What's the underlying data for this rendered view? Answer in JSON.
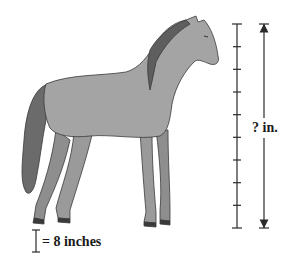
{
  "figure": {
    "measure_label": "? in.",
    "legend": {
      "unit_symbol": "I",
      "text": "= 8 inches"
    },
    "scale": {
      "tick_count": 10,
      "intervals": 9,
      "inches_per_interval": 8
    },
    "colors": {
      "horse_body": "#9e9e9e",
      "horse_dark": "#6b6b6b",
      "outline": "#3a3a3a",
      "text": "#1a1a1a"
    }
  }
}
